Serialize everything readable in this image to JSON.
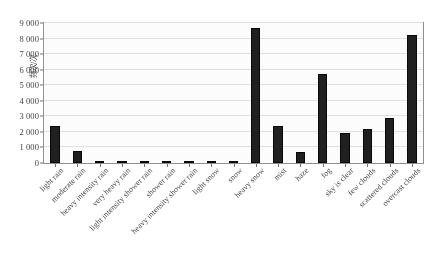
{
  "chart_data": {
    "type": "bar",
    "title": "",
    "xlabel": "",
    "ylabel": "频次/次",
    "ylim": [
      0,
      9000
    ],
    "ytick_step": 1000,
    "ytick_labels": [
      "0",
      "1 000",
      "2 000",
      "3 000",
      "4 000",
      "5 000",
      "6 000",
      "7 000",
      "8 000",
      "9 000"
    ],
    "grid": true,
    "legend": "none",
    "bar_color": "#191919",
    "categories": [
      "light rain",
      "moderate rain",
      "heavy intensity rain",
      "very heavy rain",
      "light intensity shower rain",
      "shower rain",
      "heavy intensity shower rain",
      "light snow",
      "snow",
      "heavy snow",
      "mist",
      "haze",
      "fog",
      "sky is clear",
      "few clouds",
      "scattered clouds",
      "overcast clouds"
    ],
    "values": [
      2350,
      750,
      40,
      25,
      20,
      30,
      20,
      25,
      30,
      8700,
      2400,
      700,
      5700,
      1900,
      2200,
      2900,
      8200
    ]
  },
  "caption": {
    "text": ""
  }
}
